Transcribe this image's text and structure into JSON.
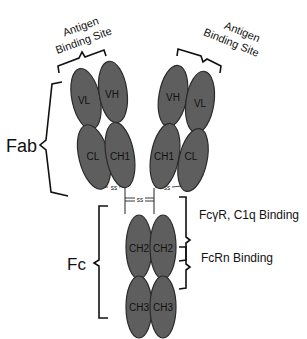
{
  "diagram": {
    "colors": {
      "domain_fill": "#5e5e5e",
      "domain_stroke": "#2a2a2a",
      "text": "#111111",
      "background": "#ffffff"
    },
    "annotations": {
      "antigen_site_left": {
        "line1": "Antigen",
        "line2": "Binding Site"
      },
      "antigen_site_right": {
        "line1": "Antigen",
        "line2": "Binding Site"
      },
      "fab": "Fab",
      "fc": "Fc",
      "fcgr_c1q": "FcγR, C1q Binding",
      "fcrn": "FcRn Binding"
    },
    "domains": {
      "left_vl": "VL",
      "left_vh": "VH",
      "left_cl": "CL",
      "left_ch1": "CH1",
      "right_vh": "VH",
      "right_vl": "VL",
      "right_ch1": "CH1",
      "right_cl": "CL",
      "left_ch2": "CH2",
      "right_ch2": "CH2",
      "left_ch3": "CH3",
      "right_ch3": "CH3"
    },
    "disulfide_bonds": {
      "left_light_heavy": "ss",
      "hinge": "ss",
      "right_light_heavy": "ss"
    }
  }
}
